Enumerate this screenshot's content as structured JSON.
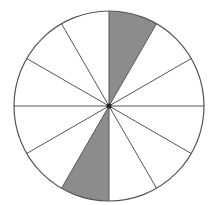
{
  "diagram": {
    "type": "fraction-circle",
    "total_sectors": 12,
    "shaded_sectors": [
      0,
      6
    ],
    "shaded_count": 2,
    "center": [
      109,
      106
    ],
    "radius": 95,
    "colors": {
      "shade": "#8c8c8c",
      "stroke": "#555555",
      "background": "#ffffff",
      "center_dot": "#222222"
    }
  }
}
